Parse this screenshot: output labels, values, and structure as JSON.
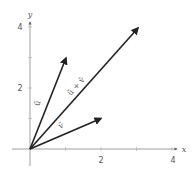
{
  "diagram": {
    "title": "",
    "axes": {
      "x_label": "x",
      "y_label": "y",
      "x_ticks": [
        {
          "value": 1,
          "label": ""
        },
        {
          "value": 2,
          "label": "2"
        },
        {
          "value": 3,
          "label": ""
        },
        {
          "value": 4,
          "label": "4"
        }
      ],
      "y_ticks": [
        {
          "value": 1,
          "label": ""
        },
        {
          "value": 2,
          "label": "2"
        },
        {
          "value": 3,
          "label": ""
        },
        {
          "value": 4,
          "label": "4"
        }
      ],
      "x_tick_labels": {
        "two": "2",
        "four": "4"
      },
      "y_tick_labels": {
        "two": "2",
        "four": "4"
      },
      "axis_color": "#888888"
    },
    "vectors": [
      {
        "name": "u",
        "label": "ū",
        "from": [
          0,
          0
        ],
        "to": [
          1,
          3
        ],
        "color": "#222222"
      },
      {
        "name": "u_plus_v",
        "label": "ū + v̄",
        "from": [
          0,
          0
        ],
        "to": [
          3,
          4
        ],
        "color": "#222222"
      },
      {
        "name": "v",
        "label": "v̄",
        "from": [
          0,
          0
        ],
        "to": [
          2,
          1
        ],
        "color": "#222222"
      }
    ],
    "labels": {
      "u": "ū",
      "v": "v̄",
      "u_plus_v": "ū + v̄"
    }
  }
}
